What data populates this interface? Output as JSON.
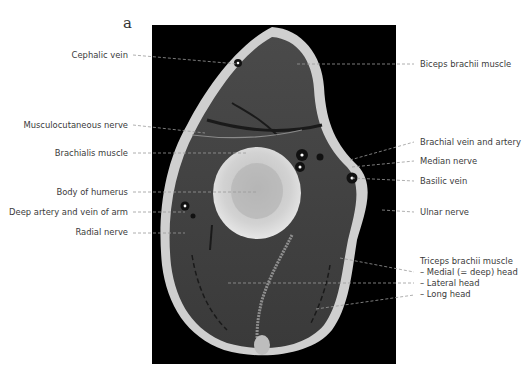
{
  "figure": {
    "panel_letter": "a",
    "colors": {
      "background": "#000000",
      "label_text": "#3a3a3a",
      "leader_line": "#9a9a9a"
    }
  },
  "labels_left": [
    {
      "id": "cephalic-vein",
      "text": "Cephalic vein"
    },
    {
      "id": "musculocutaneous-nerve",
      "text": "Musculocutaneous nerve"
    },
    {
      "id": "brachialis-muscle",
      "text": "Brachialis muscle"
    },
    {
      "id": "body-of-humerus",
      "text": "Body of humerus"
    },
    {
      "id": "deep-artery-vein-arm",
      "text": "Deep artery and vein of arm"
    },
    {
      "id": "radial-nerve",
      "text": "Radial nerve"
    }
  ],
  "labels_right": [
    {
      "id": "biceps-brachii",
      "text": "Biceps brachii muscle"
    },
    {
      "id": "brachial-vein-artery",
      "text": "Brachial vein and artery"
    },
    {
      "id": "median-nerve",
      "text": "Median nerve"
    },
    {
      "id": "basilic-vein",
      "text": "Basilic vein"
    },
    {
      "id": "ulnar-nerve",
      "text": "Ulnar nerve"
    }
  ],
  "triceps_group": {
    "title": "Triceps brachii muscle",
    "heads": [
      "– Medial (= deep) head",
      "– Lateral head",
      "– Long head"
    ]
  }
}
